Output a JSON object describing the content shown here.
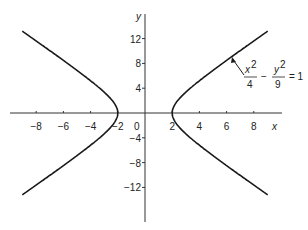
{
  "chart_data": {
    "type": "line",
    "title": "",
    "xlabel": "x",
    "ylabel": "y",
    "xlim": [
      -10,
      10
    ],
    "ylim": [
      -16,
      15
    ],
    "grid": false,
    "x_ticks": [
      -8,
      -6,
      -4,
      -2,
      2,
      4,
      6,
      8
    ],
    "x_tick_labels": [
      "−8",
      "−6",
      "−4",
      "−2",
      "2",
      "4",
      "6",
      "8"
    ],
    "y_ticks": [
      12,
      8,
      4,
      -4,
      -8,
      -12
    ],
    "y_tick_labels": [
      "12",
      "8",
      "4",
      "−4",
      "−8",
      "−12"
    ],
    "origin_label": "0",
    "equation": "x^2/4 - y^2/9 = 1",
    "annotation": {
      "num1": "x",
      "den1": "4",
      "minus": "−",
      "num2": "y",
      "den2": "9",
      "rhs": "= 1",
      "sup": "2"
    },
    "series": [
      {
        "name": "right branch",
        "x_range": [
          2,
          9
        ],
        "vertex": [
          2,
          0
        ]
      },
      {
        "name": "left branch",
        "x_range": [
          -9,
          -2
        ],
        "vertex": [
          -2,
          0
        ]
      }
    ],
    "color": "#1a1a1a"
  }
}
